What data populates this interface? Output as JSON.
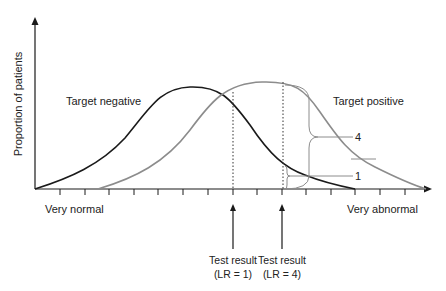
{
  "diagram": {
    "y_axis_label": "Proportion of patients",
    "x_axis_left_label": "Very normal",
    "x_axis_right_label": "Very abnormal",
    "curves": [
      {
        "name": "Target negative",
        "label": "Target negative",
        "color": "#1a1a1a"
      },
      {
        "name": "Target positive",
        "label": "Target positive",
        "color": "#8c8c8c"
      }
    ],
    "brace_labels": {
      "large": "4",
      "small": "1"
    },
    "test_results": [
      {
        "line1": "Test result",
        "line2": "(LR = 1)"
      },
      {
        "line1": "Test result",
        "line2": "(LR = 4)"
      }
    ],
    "colors": {
      "axis": "#1a1a1a",
      "negative_curve": "#1a1a1a",
      "positive_curve": "#8c8c8c",
      "annotation": "#8c8c8c",
      "text": "#222222"
    }
  }
}
